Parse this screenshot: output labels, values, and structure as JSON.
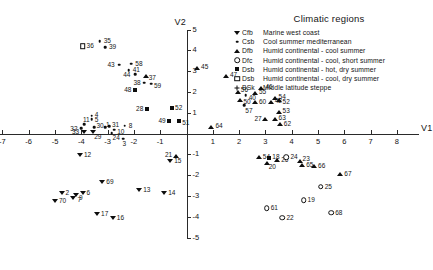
{
  "chart_data": {
    "type": "scatter",
    "title": "",
    "xlabel": "V1",
    "ylabel": "V2",
    "xlim": [
      -8,
      8
    ],
    "ylim": [
      -5,
      5
    ],
    "xticks": [
      -8,
      -7,
      -6,
      -5,
      -4,
      -3,
      -2,
      -1,
      1,
      2,
      3,
      4,
      5,
      6,
      7,
      8
    ],
    "yticks": [
      -5,
      -4,
      -3,
      -2,
      -1,
      1,
      2,
      3,
      4,
      5
    ],
    "grid": false,
    "legend_position": "top-right",
    "legend_title": "Climatic regions",
    "series": [
      {
        "name": "Cfb",
        "marker": "tri-down",
        "description": "Marine west coast",
        "points": [
          {
            "label": "12",
            "x": -4.05,
            "y": -1.05,
            "lx": 4,
            "ly": -1
          },
          {
            "label": "15",
            "x": -0.62,
            "y": -1.3,
            "lx": 4,
            "ly": -1
          },
          {
            "label": "2",
            "x": -4.75,
            "y": -2.85,
            "lx": 4,
            "ly": -1
          },
          {
            "label": "70",
            "x": -5.0,
            "y": -3.25,
            "lx": 4,
            "ly": -1
          },
          {
            "label": "7",
            "x": -4.3,
            "y": -3.1,
            "lx": 4,
            "ly": 1
          },
          {
            "label": "9",
            "x": -4.2,
            "y": -2.95,
            "lx": 3,
            "ly": 2
          },
          {
            "label": "6",
            "x": -3.95,
            "y": -2.85,
            "lx": 4,
            "ly": -1
          },
          {
            "label": "69",
            "x": -3.2,
            "y": -2.35,
            "lx": 4,
            "ly": -1
          },
          {
            "label": "13",
            "x": -1.8,
            "y": -2.7,
            "lx": 4,
            "ly": -1
          },
          {
            "label": "14",
            "x": -0.85,
            "y": -2.85,
            "lx": 4,
            "ly": -1
          },
          {
            "label": "17",
            "x": -3.4,
            "y": -3.85,
            "lx": 4,
            "ly": -1
          },
          {
            "label": "16",
            "x": -2.8,
            "y": -4.05,
            "lx": 4,
            "ly": -1
          },
          {
            "label": "33",
            "x": -3.9,
            "y": 0.08,
            "lx": -12,
            "ly": -1
          },
          {
            "label": "29",
            "x": -3.55,
            "y": 0.05,
            "lx": 1,
            "ly": 4
          }
        ]
      },
      {
        "name": "Csb",
        "marker": "dot",
        "description": "Cool summer  mediterranean",
        "points": [
          {
            "label": "35",
            "x": -3.3,
            "y": 4.45,
            "lx": 4,
            "ly": -1
          },
          {
            "label": "39",
            "x": -3.1,
            "y": 4.15,
            "lx": 4,
            "ly": -1
          },
          {
            "label": "43",
            "x": -2.55,
            "y": 3.3,
            "lx": -12,
            "ly": -1
          },
          {
            "label": "58",
            "x": -2.1,
            "y": 3.35,
            "lx": 4,
            "ly": -1
          },
          {
            "label": "41",
            "x": -2.2,
            "y": 3.05,
            "lx": 4,
            "ly": -1
          },
          {
            "label": "44",
            "x": -1.95,
            "y": 2.85,
            "lx": -12,
            "ly": 0
          },
          {
            "label": "59",
            "x": -1.35,
            "y": 2.4,
            "lx": 3,
            "ly": 1
          },
          {
            "label": "38",
            "x": -1.6,
            "y": 2.45,
            "lx": -11,
            "ly": -1
          },
          {
            "label": "40",
            "x": 2.25,
            "y": 1.85,
            "lx": 3,
            "ly": 2
          },
          {
            "label": "57",
            "x": 2.2,
            "y": 1.35,
            "lx": 1,
            "ly": 5
          },
          {
            "label": "4",
            "x": -3.6,
            "y": 0.85,
            "lx": 3,
            "ly": -2
          },
          {
            "label": "5",
            "x": -3.6,
            "y": 0.68,
            "lx": 3,
            "ly": 0
          },
          {
            "label": "11",
            "x": -3.9,
            "y": 0.45,
            "lx": -1,
            "ly": -5
          },
          {
            "label": "32",
            "x": -4.0,
            "y": 0.25,
            "lx": -11,
            "ly": 0
          },
          {
            "label": "30",
            "x": -3.5,
            "y": 0.3,
            "lx": 2,
            "ly": -2
          },
          {
            "label": "1",
            "x": -3.1,
            "y": 0.3,
            "lx": 1,
            "ly": -3
          },
          {
            "label": "31",
            "x": -2.95,
            "y": 0.35,
            "lx": 3,
            "ly": -2
          },
          {
            "label": "10",
            "x": -2.75,
            "y": 0.18,
            "lx": 3,
            "ly": 1
          },
          {
            "label": "24",
            "x": -2.85,
            "y": 0.02,
            "lx": 1,
            "ly": 4
          },
          {
            "label": "8",
            "x": -2.35,
            "y": 0.38,
            "lx": 4,
            "ly": -1
          },
          {
            "label": "3",
            "x": -2.4,
            "y": -0.25,
            "lx": -1,
            "ly": 4
          }
        ]
      },
      {
        "name": "Dfb",
        "marker": "tri-up",
        "description": "Humid continental - cool summer",
        "points": [
          {
            "label": "45",
            "x": 0.4,
            "y": 3.15,
            "lx": 4,
            "ly": -2
          },
          {
            "label": "37",
            "x": -1.55,
            "y": 2.78,
            "lx": 3,
            "ly": 1
          },
          {
            "label": "47",
            "x": 1.5,
            "y": 2.75,
            "lx": 4,
            "ly": -2
          },
          {
            "label": "46",
            "x": 2.85,
            "y": 2.2,
            "lx": 4,
            "ly": -2
          },
          {
            "label": "55",
            "x": 2.6,
            "y": 1.95,
            "lx": 4,
            "ly": -2
          },
          {
            "label": "56",
            "x": 1.95,
            "y": 2.0,
            "lx": 3,
            "ly": -3
          },
          {
            "label": "54",
            "x": 3.35,
            "y": 1.72,
            "lx": 4,
            "ly": -2
          },
          {
            "label": "52",
            "x": 3.5,
            "y": 1.6,
            "lx": 4,
            "ly": 1
          },
          {
            "label": "50",
            "x": 2.05,
            "y": 1.62,
            "lx": 3,
            "ly": 1
          },
          {
            "label": "60",
            "x": 2.6,
            "y": 1.5,
            "lx": 4,
            "ly": -1
          },
          {
            "label": "42",
            "x": 3.2,
            "y": 1.5,
            "lx": 4,
            "ly": -2
          },
          {
            "label": "53",
            "x": 3.5,
            "y": 1.02,
            "lx": 4,
            "ly": -2
          },
          {
            "label": "27",
            "x": 3.0,
            "y": 0.72,
            "lx": -11,
            "ly": -1
          },
          {
            "label": "63",
            "x": 3.35,
            "y": 0.72,
            "lx": 4,
            "ly": -2
          },
          {
            "label": "62",
            "x": 3.55,
            "y": 0.45,
            "lx": 4,
            "ly": -1
          },
          {
            "label": "64",
            "x": 0.95,
            "y": 0.32,
            "lx": 4,
            "ly": -2
          },
          {
            "label": "21",
            "x": -0.4,
            "y": -1.1,
            "lx": -11,
            "ly": -2
          },
          {
            "label": "54b",
            "x": 2.75,
            "y": -1.15,
            "lx": 4,
            "ly": -1
          },
          {
            "label": "26",
            "x": 3.45,
            "y": -1.25,
            "lx": 4,
            "ly": -1
          },
          {
            "label": "20",
            "x": 3.05,
            "y": -1.4,
            "lx": 2,
            "ly": 3
          },
          {
            "label": "23",
            "x": 4.3,
            "y": -1.3,
            "lx": 3,
            "ly": -3
          },
          {
            "label": "65",
            "x": 4.4,
            "y": -1.5,
            "lx": 4,
            "ly": -1
          },
          {
            "label": "66",
            "x": 4.85,
            "y": -1.55,
            "lx": 4,
            "ly": -1
          },
          {
            "label": "67",
            "x": 5.85,
            "y": -1.95,
            "lx": 4,
            "ly": -1
          }
        ]
      },
      {
        "name": "Dfc",
        "marker": "circle-open",
        "description": "Humid continental - cool,  short summer",
        "points": [
          {
            "label": "24b",
            "x": 3.8,
            "y": -1.15,
            "lx": 4,
            "ly": -1
          },
          {
            "label": "25",
            "x": 5.1,
            "y": -2.55,
            "lx": 4,
            "ly": -1
          },
          {
            "label": "19",
            "x": 4.45,
            "y": -3.2,
            "lx": 4,
            "ly": -1
          },
          {
            "label": "61",
            "x": 3.05,
            "y": -3.6,
            "lx": 4,
            "ly": -1
          },
          {
            "label": "22",
            "x": 3.65,
            "y": -4.05,
            "lx": 4,
            "ly": -1
          },
          {
            "label": "68",
            "x": 5.5,
            "y": -3.8,
            "lx": 4,
            "ly": -1
          }
        ]
      },
      {
        "name": "Dsb",
        "marker": "square",
        "description": "Humid continental - hot, dry summer",
        "points": [
          {
            "label": "48",
            "x": -1.95,
            "y": 2.1,
            "lx": -11,
            "ly": -1
          },
          {
            "label": "28",
            "x": -1.5,
            "y": 1.2,
            "lx": -11,
            "ly": -1
          },
          {
            "label": "52b",
            "x": -0.55,
            "y": 1.22,
            "lx": 3,
            "ly": -1
          },
          {
            "label": "49",
            "x": -0.65,
            "y": 0.62,
            "lx": -11,
            "ly": -1
          },
          {
            "label": "51",
            "x": -0.28,
            "y": 0.6,
            "lx": 3,
            "ly": 1
          },
          {
            "label": "18",
            "x": 3.15,
            "y": -1.18,
            "lx": 3,
            "ly": -2
          }
        ]
      },
      {
        "name": "Dsb2",
        "marker": "square-open",
        "description": "Humid continental - cool, dry summer",
        "points": [
          {
            "label": "36",
            "x": -3.95,
            "y": 4.2,
            "lx": 4,
            "ly": -1
          }
        ]
      },
      {
        "name": "BSk",
        "marker": "plus",
        "description": "Middle latitude steppe",
        "points": []
      }
    ],
    "legend_entries": [
      {
        "code": "Cfb",
        "marker": "tri-down",
        "text": "Marine west coast"
      },
      {
        "code": "Csb",
        "marker": "dot",
        "text": "Cool summer  mediterranean"
      },
      {
        "code": "Dfb",
        "marker": "tri-up",
        "text": "Humid continental - cool summer"
      },
      {
        "code": "Dfc",
        "marker": "circle-open",
        "text": "Humid continental - cool,  short summer"
      },
      {
        "code": "Dsb",
        "marker": "square",
        "text": "Humid  continental - hot, dry summer"
      },
      {
        "code": "Dsb",
        "marker": "square-open",
        "text": "Humid continental - cool, dry summer"
      },
      {
        "code": "BSk",
        "marker": "plus",
        "text": "Middle latitude steppe"
      }
    ]
  },
  "axes": {
    "x_name": "V1",
    "y_name": "V2"
  }
}
